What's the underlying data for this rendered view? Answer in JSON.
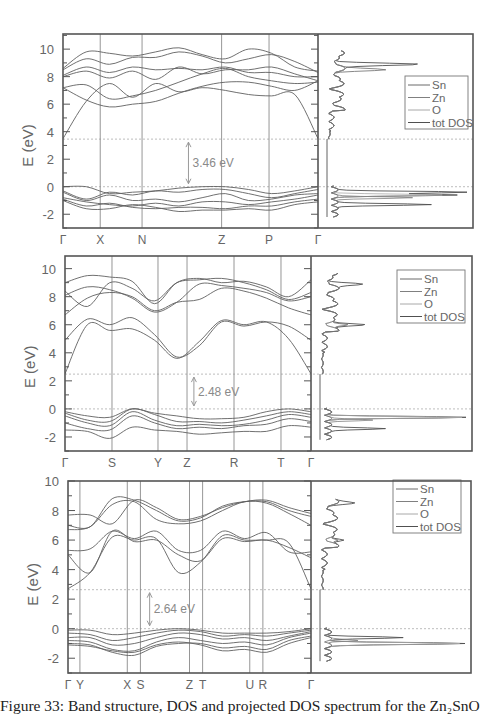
{
  "figure": {
    "caption": "Figure 33: Band structure, DOS and projected DOS spectrum for the Zn₂SnO",
    "ylabel": "E (eV)",
    "yticks": [
      10,
      8,
      6,
      4,
      2,
      0,
      -2
    ],
    "legend": [
      "Sn",
      "Zn",
      "O",
      "tot DOS"
    ],
    "colors": {
      "frame": "#555555",
      "band": "#606060",
      "gap_line": "#bdbdbd",
      "arrow": "#9a9a9a",
      "gap_text": "#8a8a8a"
    }
  },
  "chart_data": [
    {
      "type": "line",
      "title": "Band structure + DOS (panel 1)",
      "xlabel": "",
      "ylabel": "E (eV)",
      "ylim": [
        -3,
        11
      ],
      "kpoints": [
        "Γ",
        "X",
        "N",
        "Z",
        "P",
        "Γ"
      ],
      "kpos": [
        0,
        0.146,
        0.31,
        0.622,
        0.808,
        1.0
      ],
      "band_gap": "3.46 eV",
      "cbm": 3.46,
      "vbm": 0,
      "conduction_bands": [
        [
          3.5,
          6.2,
          7.5,
          6.5,
          7.5,
          6.9,
          7.2,
          7.0,
          6.7,
          6.6,
          6.7,
          3.5
        ],
        [
          7.2,
          6.3,
          5.8,
          6.0,
          6.2,
          6.8,
          7.3,
          7.6,
          7.6,
          7.3,
          7.0,
          7.7
        ],
        [
          7.2,
          7.4,
          6.4,
          6.6,
          7.0,
          7.6,
          8.2,
          8.6,
          8.0,
          7.7,
          7.5,
          7.6
        ],
        [
          8.0,
          8.4,
          7.9,
          8.4,
          7.8,
          8.7,
          8.2,
          8.5,
          8.5,
          8.7,
          8.2,
          7.7
        ],
        [
          8.1,
          8.7,
          8.3,
          8.7,
          8.5,
          8.6,
          8.5,
          8.7,
          8.3,
          8.3,
          8.0,
          8.0
        ],
        [
          8.5,
          9.3,
          8.9,
          9.4,
          9.4,
          9.8,
          9.5,
          9.0,
          9.3,
          9.6,
          9.1,
          8.3
        ],
        [
          8.6,
          9.8,
          9.7,
          9.5,
          9.8,
          10.1,
          9.6,
          9.3,
          10.0,
          9.7,
          8.7,
          8.4
        ]
      ],
      "valence_bands": [
        [
          0.0,
          0.0,
          -0.5,
          -0.4,
          -0.3,
          -0.1,
          0.0,
          0.0,
          -0.2,
          -0.5,
          -0.3,
          0.0
        ],
        [
          -0.3,
          -0.9,
          -0.4,
          -0.6,
          -0.3,
          -0.4,
          -0.2,
          -0.2,
          -0.5,
          -0.8,
          -0.5,
          -0.2
        ],
        [
          -0.4,
          -1.0,
          -0.6,
          -1.0,
          -0.9,
          -1.1,
          -0.8,
          -0.5,
          -1.0,
          -0.9,
          -0.6,
          -0.5
        ],
        [
          -0.8,
          -1.1,
          -1.3,
          -1.4,
          -1.2,
          -1.4,
          -1.1,
          -1.1,
          -1.3,
          -1.1,
          -0.9,
          -0.6
        ],
        [
          -0.9,
          -1.4,
          -1.2,
          -1.5,
          -1.6,
          -1.5,
          -1.5,
          -1.6,
          -1.4,
          -1.4,
          -1.1,
          -0.9
        ],
        [
          -1.0,
          -1.6,
          -1.6,
          -1.3,
          -1.5,
          -1.8,
          -1.7,
          -1.7,
          -1.6,
          -1.7,
          -1.3,
          -1.1
        ]
      ],
      "dos_peaks": {
        "tot DOS": [
          [
            -0.4,
            1.0
          ],
          [
            -1.3,
            0.7
          ],
          [
            8.9,
            0.6
          ],
          [
            -0.6,
            0.85
          ]
        ],
        "O": [
          [
            -0.6,
            0.75
          ]
        ],
        "Zn": [
          [
            -0.8,
            0.55
          ]
        ],
        "Sn": [
          [
            8.5,
            0.3
          ]
        ]
      },
      "legend": [
        "Sn",
        "Zn",
        "O",
        "tot DOS"
      ]
    },
    {
      "type": "line",
      "title": "Band structure + DOS (panel 2)",
      "xlabel": "",
      "ylabel": "E (eV)",
      "ylim": [
        -3,
        11
      ],
      "kpoints": [
        "Γ",
        "S",
        "Y",
        "Z",
        "R",
        "T",
        "Γ"
      ],
      "kpos": [
        0,
        0.191,
        0.378,
        0.496,
        0.687,
        0.878,
        1.0
      ],
      "band_gap": "2.48 eV",
      "cbm": 2.48,
      "vbm": 0,
      "conduction_bands": [
        [
          2.5,
          6.0,
          5.6,
          5.7,
          4.9,
          3.6,
          4.8,
          6.3,
          6.0,
          6.2,
          5.0,
          2.5
        ],
        [
          4.9,
          6.4,
          6.0,
          6.5,
          5.3,
          3.7,
          4.5,
          6.2,
          5.9,
          6.2,
          5.9,
          4.9
        ],
        [
          6.7,
          7.9,
          8.3,
          8.0,
          7.0,
          7.6,
          7.8,
          8.6,
          8.4,
          7.9,
          7.2,
          6.7
        ],
        [
          8.1,
          8.7,
          8.5,
          7.9,
          6.9,
          7.6,
          8.9,
          8.8,
          8.6,
          8.3,
          7.7,
          8.0
        ],
        [
          8.4,
          7.3,
          9.0,
          8.6,
          7.7,
          9.0,
          9.2,
          9.3,
          9.0,
          8.5,
          7.8,
          8.3
        ],
        [
          9.0,
          9.5,
          9.4,
          9.1,
          7.5,
          9.0,
          9.3,
          9.0,
          9.1,
          8.7,
          8.0,
          9.2
        ]
      ],
      "valence_bands": [
        [
          -0.2,
          -0.5,
          -0.6,
          0.0,
          -0.3,
          -0.5,
          -0.7,
          -0.7,
          -0.6,
          -0.2,
          0.0,
          -0.2
        ],
        [
          -0.3,
          -0.8,
          -0.9,
          0.0,
          -0.4,
          -0.9,
          -0.9,
          -1.0,
          -0.8,
          -0.5,
          -0.2,
          -0.4
        ],
        [
          -0.5,
          -1.0,
          -1.2,
          -0.2,
          -0.8,
          -1.2,
          -1.1,
          -1.2,
          -1.1,
          -0.8,
          -0.4,
          -0.6
        ],
        [
          -1.0,
          -1.4,
          -1.5,
          -0.5,
          -1.0,
          -1.4,
          -1.3,
          -1.4,
          -1.2,
          -1.1,
          -0.7,
          -0.9
        ],
        [
          -1.5,
          -1.6,
          -2.1,
          -1.3,
          -1.5,
          -1.6,
          -1.8,
          -1.7,
          -1.6,
          -1.6,
          -1.2,
          -1.3
        ]
      ],
      "dos_peaks": {
        "tot DOS": [
          [
            -0.6,
            1.0
          ],
          [
            -1.4,
            0.4
          ],
          [
            6.0,
            0.27
          ],
          [
            8.9,
            0.23
          ]
        ],
        "O": [
          [
            -0.6,
            0.9
          ]
        ],
        "Zn": [
          [
            -0.8,
            0.3
          ]
        ],
        "Sn": [
          [
            6.0,
            0.15
          ]
        ]
      },
      "legend": [
        "Sn",
        "Zn",
        "O",
        "tot DOS"
      ]
    },
    {
      "type": "line",
      "title": "Band structure + DOS (panel 3)",
      "xlabel": "",
      "ylabel": "E (eV)",
      "ylim": [
        -3,
        10
      ],
      "kpoints": [
        "Γ",
        "Y",
        "X",
        "S",
        "Z",
        "T",
        "U",
        "R",
        "Γ"
      ],
      "kpos": [
        0,
        0.049,
        0.244,
        0.298,
        0.5,
        0.554,
        0.748,
        0.802,
        1.0
      ],
      "band_gap": "2.64 eV",
      "cbm": 2.64,
      "vbm": 0,
      "conduction_bands": [
        [
          2.7,
          3.8,
          6.2,
          6.0,
          6.1,
          3.8,
          4.5,
          6.3,
          6.0,
          6.0,
          5.8,
          2.7
        ],
        [
          5.0,
          3.8,
          6.6,
          5.9,
          6.0,
          5.0,
          4.6,
          6.1,
          5.9,
          6.0,
          5.5,
          4.8
        ],
        [
          5.3,
          5.4,
          6.6,
          6.1,
          6.6,
          5.3,
          5.3,
          6.6,
          6.1,
          6.5,
          5.2,
          5.2
        ],
        [
          6.7,
          6.9,
          8.4,
          8.6,
          7.4,
          7.1,
          7.3,
          8.0,
          8.6,
          8.5,
          7.8,
          7.0
        ],
        [
          7.0,
          6.9,
          8.8,
          8.7,
          8.0,
          7.3,
          7.5,
          8.3,
          8.6,
          8.6,
          8.0,
          7.6
        ],
        [
          7.7,
          7.7,
          7.1,
          8.7,
          8.2,
          7.4,
          7.6,
          8.2,
          8.6,
          8.7,
          8.2,
          7.8
        ]
      ],
      "valence_bands": [
        [
          -0.1,
          -0.1,
          -0.4,
          -0.3,
          -0.1,
          0.0,
          -0.1,
          -0.3,
          -0.3,
          -0.3,
          -0.2,
          0.0
        ],
        [
          -0.3,
          -0.4,
          -0.8,
          -0.6,
          -0.3,
          -0.1,
          -0.2,
          -0.5,
          -0.4,
          -0.5,
          -0.3,
          -0.1
        ],
        [
          -0.6,
          -0.6,
          -1.1,
          -1.0,
          -0.6,
          -0.3,
          -0.4,
          -0.7,
          -0.6,
          -0.8,
          -0.5,
          -0.2
        ],
        [
          -0.8,
          -0.9,
          -1.4,
          -1.5,
          -0.9,
          -0.6,
          -0.8,
          -1.0,
          -0.9,
          -1.1,
          -0.6,
          -0.3
        ],
        [
          -1.0,
          -1.1,
          -1.6,
          -1.8,
          -1.2,
          -1.0,
          -1.0,
          -1.3,
          -1.2,
          -1.4,
          -0.8,
          -0.5
        ],
        [
          -1.1,
          -1.2,
          -1.5,
          -1.6,
          -1.1,
          -0.9,
          -1.1,
          -1.5,
          -1.4,
          -1.6,
          -1.0,
          -0.6
        ]
      ],
      "dos_peaks": {
        "tot DOS": [
          [
            -1.0,
            1.0
          ],
          [
            -0.6,
            0.5
          ],
          [
            8.5,
            0.12
          ],
          [
            6.0,
            0.12
          ]
        ],
        "O": [
          [
            -1.0,
            0.9
          ]
        ],
        "Zn": [
          [
            -0.8,
            0.2
          ]
        ],
        "Sn": [
          [
            6.0,
            0.08
          ]
        ]
      },
      "legend": [
        "Sn",
        "Zn",
        "O",
        "tot DOS"
      ]
    }
  ],
  "layout": {
    "panels": [
      {
        "left": 63,
        "top": 34,
        "right": 473,
        "bottom": 228,
        "split": 318,
        "e_top": 11.1,
        "e_bot": -3.0,
        "legend_x": 405,
        "legend_y": 76
      },
      {
        "left": 65,
        "top": 256,
        "right": 472,
        "bottom": 451,
        "split": 311,
        "e_top": 10.9,
        "e_bot": -3.0,
        "legend_x": 397,
        "legend_y": 270
      },
      {
        "left": 68,
        "top": 481,
        "right": 471,
        "bottom": 673,
        "split": 311,
        "e_top": 10.0,
        "e_bot": -3.0,
        "legend_x": 393,
        "legend_y": 480
      }
    ]
  }
}
